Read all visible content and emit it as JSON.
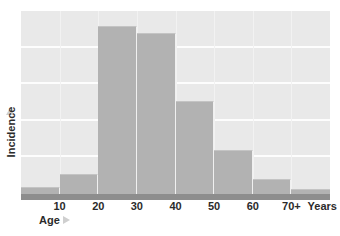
{
  "figure": {
    "background_color": "#ffffff",
    "plot_background_color": "#e9e9e9",
    "bar_color": "#b2b2b2",
    "axis_bar_color": "#8d8d8d",
    "gridline_color": "#fdfdfd",
    "arrow_color": "#cfcfcf",
    "caption_text": ""
  },
  "axes": {
    "y_title": "Incidence",
    "y_arrow_icon": "up-triangle-icon",
    "x_title": "Age",
    "x_arrow_icon": "right-triangle-icon",
    "x_unit_label": "Years"
  },
  "chart_data": {
    "type": "bar",
    "title": "",
    "xlabel": "Age",
    "ylabel": "Incidence",
    "xlim": [
      0,
      80
    ],
    "ylim": [
      0,
      100
    ],
    "grid": true,
    "legend": "none",
    "bin_width": 10,
    "x_tick_labels": [
      "10",
      "20",
      "30",
      "40",
      "50",
      "60",
      "70+",
      "Years"
    ],
    "x_tick_positions": [
      10,
      20,
      30,
      40,
      50,
      60,
      70,
      78
    ],
    "gridline_values": [
      20,
      40,
      60,
      80,
      100
    ],
    "categories": [
      "0-10",
      "10-20",
      "20-30",
      "30-40",
      "40-50",
      "50-60",
      "60-70",
      "70+"
    ],
    "values": [
      4,
      11,
      92,
      88,
      51,
      24,
      8,
      3
    ],
    "bar_bin_starts": [
      0,
      10,
      20,
      30,
      40,
      50,
      60,
      70
    ]
  }
}
